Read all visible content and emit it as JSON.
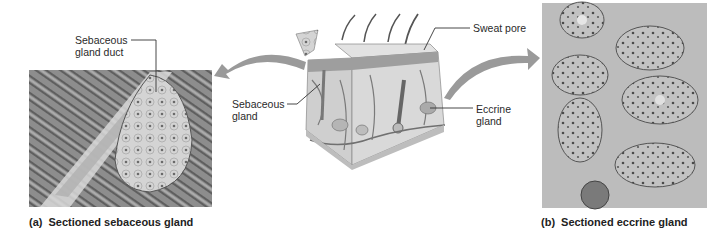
{
  "figure": {
    "panel_a": {
      "caption_tag": "(a)",
      "caption_text": "Sectioned sebaceous gland",
      "label_duct_line1": "Sebaceous",
      "label_duct_line2": "gland duct"
    },
    "panel_b": {
      "caption_tag": "(b)",
      "caption_text": "Sectioned eccrine gland"
    },
    "center": {
      "label_sweat_pore": "Sweat pore",
      "label_sebaceous_line1": "Sebaceous",
      "label_sebaceous_line2": "gland",
      "label_eccrine_line1": "Eccrine",
      "label_eccrine_line2": "gland"
    },
    "colors": {
      "arrow": "#9a9a9a",
      "leader": "#333333",
      "micrograph_bg": "#b9b9b9"
    }
  }
}
